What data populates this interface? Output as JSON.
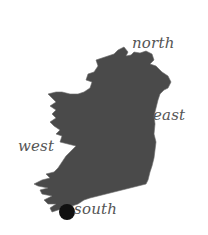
{
  "map": {
    "title": "Ireland compass map",
    "region": "Ireland",
    "fill_color": "#4a4a4a",
    "marker_color": "#111111",
    "label_color": "#555555",
    "labels": {
      "north": "north",
      "east": "east",
      "west": "west",
      "south": "south"
    },
    "marker": {
      "icon": "location-dot",
      "near_label": "south"
    }
  }
}
